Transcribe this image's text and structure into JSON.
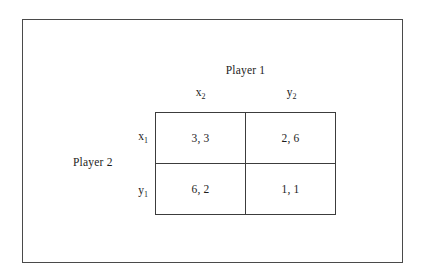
{
  "figure": {
    "type": "payoff-matrix",
    "column_player": "Player 1",
    "row_player": "Player 2",
    "column_labels": [
      "x",
      "y"
    ],
    "column_label_subscripts": [
      "2",
      "2"
    ],
    "row_labels": [
      "x",
      "y"
    ],
    "row_label_subscripts": [
      "1",
      "1"
    ],
    "cells": [
      [
        {
          "payoff": "3, 3",
          "row": "x1",
          "column": "x2"
        },
        {
          "payoff": "2, 6",
          "row": "x1",
          "column": "y2"
        }
      ],
      [
        {
          "payoff": "6, 2",
          "row": "y1",
          "column": "x2"
        },
        {
          "payoff": "1, 1",
          "row": "y1",
          "column": "y2"
        }
      ]
    ],
    "colors": {
      "background": "#ffffff",
      "text": "#1d1d1d",
      "grid_line": "#3c3c3c",
      "outer_frame": "#4a4a4a"
    }
  }
}
